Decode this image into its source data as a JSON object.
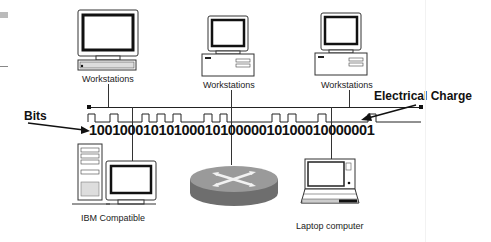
{
  "diagram": {
    "nodes": [
      {
        "id": "ws1",
        "type": "workstation-desktop-flat",
        "label": "Workstations"
      },
      {
        "id": "ws2",
        "type": "workstation-desktop",
        "label": "Workstations"
      },
      {
        "id": "ws3",
        "type": "workstation-desktop",
        "label": "Workstations"
      },
      {
        "id": "pc",
        "type": "tower-pc",
        "label": "IBM Compatible"
      },
      {
        "id": "router",
        "type": "router",
        "label": ""
      },
      {
        "id": "laptop",
        "type": "laptop",
        "label": "Laptop computer"
      }
    ],
    "annotations": {
      "bits_label": "Bits",
      "charge_label": "Electrical Charge"
    },
    "bit_string": "1001000101010001010000010100010000001",
    "colors": {
      "line": "#222222",
      "router_top": "#9a9a9a",
      "router_side": "#6e6e6e",
      "screen_bezel": "#111111"
    }
  }
}
